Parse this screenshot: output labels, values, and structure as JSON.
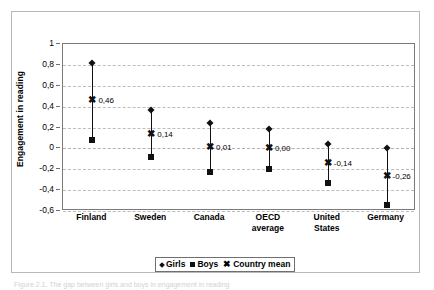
{
  "figure": {
    "y_axis_title": "Engagement in reading",
    "caption": "Figure 2.1. The gap between girls and boys in engagement in reading"
  },
  "legend": {
    "items": [
      {
        "label": "Girls",
        "marker": "diamond-icon"
      },
      {
        "label": "Boys",
        "marker": "square-icon"
      },
      {
        "label": "Country mean",
        "marker": "x-icon"
      }
    ]
  },
  "chart_data": {
    "type": "scatter",
    "title": "",
    "xlabel": "",
    "ylabel": "Engagement in reading",
    "ylim": [
      -0.6,
      1
    ],
    "yticks": [
      1,
      0.8,
      0.6,
      0.4,
      0.2,
      0,
      -0.2,
      -0.4,
      -0.6
    ],
    "ytick_labels": [
      "1",
      "0,8",
      "0,6",
      "0,4",
      "0,2",
      "0",
      "-0,2",
      "-0,4",
      "-0,6"
    ],
    "grid": true,
    "legend_position": "bottom",
    "categories": [
      "Finland",
      "Sweden",
      "Canada",
      "OECD\naverage",
      "United\nStates",
      "Germany"
    ],
    "series": [
      {
        "name": "Girls",
        "values": [
          0.82,
          0.37,
          0.24,
          0.19,
          0.04,
          0.0
        ]
      },
      {
        "name": "Boys",
        "values": [
          0.08,
          -0.08,
          -0.23,
          -0.2,
          -0.33,
          -0.54
        ]
      },
      {
        "name": "Country mean",
        "values": [
          0.46,
          0.14,
          0.01,
          0.0,
          -0.14,
          -0.26
        ]
      }
    ],
    "mean_labels": [
      "0,46",
      "0,14",
      "0,01",
      "0,00",
      "-0,14",
      "-0,26"
    ]
  }
}
